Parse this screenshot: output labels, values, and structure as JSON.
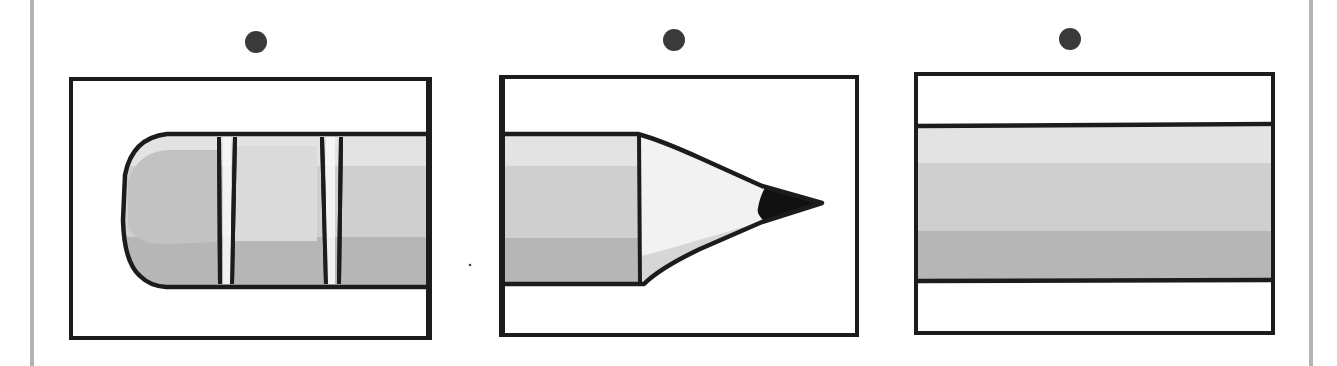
{
  "scene": {
    "description": "Three panels showing parts of a pencil: eraser end, sharpened tip, and middle body",
    "colors": {
      "outline": "#1c1c1c",
      "dot": "#3a3a3a",
      "band_light": "#e3e3e3",
      "band_mid": "#cfcfcf",
      "band_dark": "#b6b6b6",
      "wood": "#f0f0f0",
      "wood_shadow": "#d9d9d9",
      "lead": "#111111",
      "border_bar": "#b3b3b3"
    },
    "panels": [
      {
        "id": "eraser-end",
        "label": "Pencil eraser end"
      },
      {
        "id": "sharpened-tip",
        "label": "Pencil sharpened tip"
      },
      {
        "id": "middle-body",
        "label": "Pencil middle body"
      }
    ]
  }
}
